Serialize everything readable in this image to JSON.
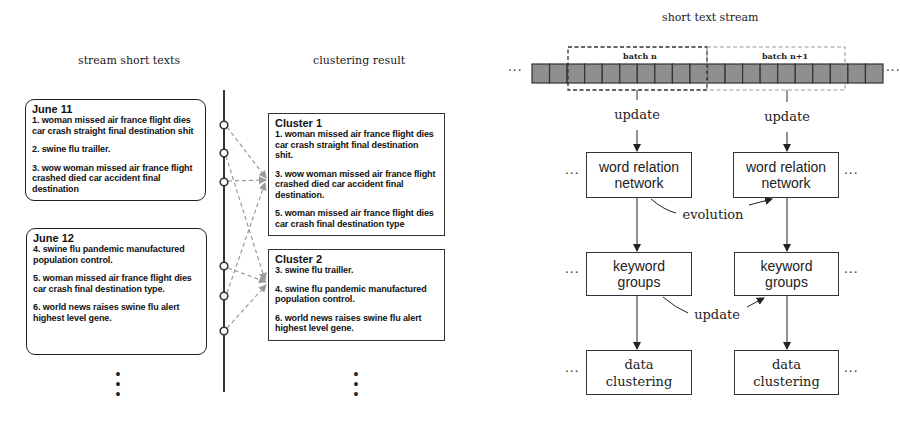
{
  "left_panel": {
    "stream_title": "stream short texts",
    "clustering_title": "clustering result",
    "days": [
      {
        "label": "June 11",
        "items": [
          "1.  woman missed air france flight dies car crash straight final destination shit",
          "2.  swine flu trailler.",
          "3.  wow woman missed air france flight crashed died car accident final destination"
        ]
      },
      {
        "label": "June 12",
        "items": [
          "4.  swine flu pandemic manufactured population control.",
          "5. woman missed air france flight dies car crash final destination type.",
          "6.  world news raises swine flu alert highest level gene."
        ]
      }
    ],
    "clusters": [
      {
        "label": "Cluster 1",
        "items": [
          " 1.  woman missed air france flight dies car crash straight final destination shit.",
          " 3.  wow woman missed air france flight crashed died car accident final destination.",
          " 5.  woman missed air france flight dies car crash final destination type"
        ]
      },
      {
        "label": "Cluster 2",
        "items": [
          "3.  swine flu trailler.",
          "4.  swine flu pandemic manufactured population control.",
          "6.  world news raises swine flu alert highest level gene."
        ]
      }
    ],
    "continuation": "•\n•\n•"
  },
  "right_panel": {
    "title": "short text stream",
    "batches": [
      "batch n",
      "batch n+1"
    ],
    "stream_cells": 20,
    "ellipsis": "···",
    "update_label": "update",
    "evolution_label": "evolution",
    "keyword_update_label": "update",
    "columns": [
      {
        "word_relation_network": [
          "word relation",
          "network"
        ],
        "keyword_groups": [
          "keyword",
          "groups"
        ],
        "data_clustering": [
          "data",
          "clustering"
        ]
      },
      {
        "word_relation_network": [
          "word relation",
          "network"
        ],
        "keyword_groups": [
          "keyword",
          "groups"
        ],
        "data_clustering": [
          "data",
          "clustering"
        ]
      }
    ]
  },
  "colors": {
    "cell_fill": "#8f8f8f",
    "cell_border": "#333333",
    "dashed_arrow": "#9a9a9a",
    "batch_n_border": "#333333",
    "batch_n1_border": "#9a9a9a"
  }
}
